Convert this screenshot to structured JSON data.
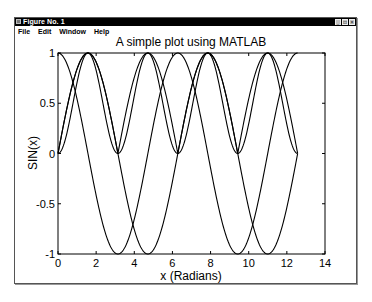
{
  "window": {
    "title": "Figure No. 1",
    "buttons": [
      "minimize",
      "maximize",
      "close"
    ]
  },
  "menubar": {
    "items": [
      "File",
      "Edit",
      "Window",
      "Help"
    ]
  },
  "chart_data": {
    "type": "line",
    "title": "A simple plot using MATLAB",
    "xlabel": "x (Radians)",
    "ylabel": "SIN(x)",
    "xlim": [
      0,
      14
    ],
    "ylim": [
      -1,
      1
    ],
    "xticks": [
      0,
      2,
      4,
      6,
      8,
      10,
      12,
      14
    ],
    "yticks": [
      -1,
      -0.5,
      0,
      0.5,
      1
    ],
    "xtick_labels": [
      "0",
      "2",
      "4",
      "6",
      "8",
      "10",
      "12",
      "14"
    ],
    "ytick_labels": [
      "-1",
      "-0.5",
      "0",
      "0.5",
      "1"
    ],
    "grid": false,
    "legend": null,
    "x_range": [
      0,
      12.566
    ],
    "series": [
      {
        "name": "sin(x)",
        "function": "sin",
        "color": "#000000"
      },
      {
        "name": "cos(x)",
        "function": "cos",
        "color": "#000000"
      },
      {
        "name": "|sin(x)|",
        "function": "abs_sin",
        "color": "#000000"
      },
      {
        "name": "sin(x)^2",
        "function": "sin_squared",
        "color": "#000000"
      }
    ],
    "sample_points": {
      "x": [
        0,
        1.571,
        3.142,
        4.712,
        6.283,
        7.854,
        9.425,
        10.996,
        12.566
      ],
      "sin(x)": [
        0,
        1,
        0,
        -1,
        0,
        1,
        0,
        -1,
        0
      ],
      "cos(x)": [
        1,
        0,
        -1,
        0,
        1,
        0,
        -1,
        0,
        1
      ],
      "|sin(x)|": [
        0,
        1,
        0,
        1,
        0,
        1,
        0,
        1,
        0
      ],
      "sin(x)^2": [
        0,
        1,
        0,
        1,
        0,
        1,
        0,
        1,
        0
      ]
    }
  }
}
